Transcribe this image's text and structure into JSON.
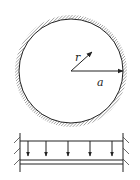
{
  "figure": {
    "circle_diagram": {
      "labels": {
        "inner_radius": "r",
        "outer_radius": "a"
      },
      "description": "circular region of radius a with fixed (hatched) boundary; radial vector r from center"
    },
    "beam_diagram": {
      "load_arrow_count": 5,
      "description": "strip clamped at both ends under uniform downward load"
    },
    "colors": {
      "stroke": "#222222",
      "hatch": "#555555",
      "background": "#ffffff"
    }
  }
}
